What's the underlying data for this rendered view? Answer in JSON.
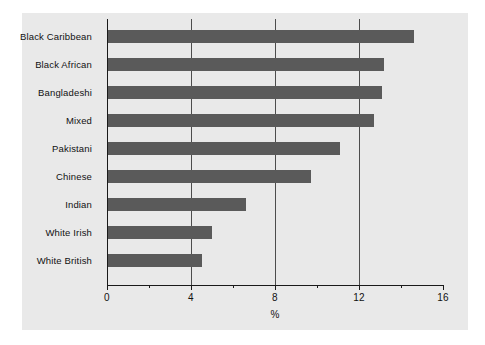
{
  "chart_data": {
    "type": "bar",
    "orientation": "horizontal",
    "title": "",
    "subtitle": "",
    "xlabel": "%",
    "ylabel": "",
    "categories": [
      "Black Caribbean",
      "Black African",
      "Bangladeshi",
      "Mixed",
      "Pakistani",
      "Chinese",
      "Indian",
      "White Irish",
      "White British"
    ],
    "values": [
      14.6,
      13.2,
      13.1,
      12.7,
      11.1,
      9.7,
      6.6,
      5.0,
      4.5
    ],
    "xlim": [
      0,
      16
    ],
    "xticks": [
      0,
      4,
      8,
      12,
      16
    ],
    "xticklabels": [
      "0",
      "4",
      "8",
      "12",
      "16"
    ],
    "xminorticks": [
      2,
      6,
      10,
      14
    ],
    "gridlines": [
      4,
      8,
      12
    ],
    "grid": true,
    "legend": null,
    "legend_position": "none",
    "bar_color": "#5a5a5a",
    "panel_color": "#e9e9e9",
    "axis_color": "#1a1a1a",
    "grid_color": "#4d4d4d",
    "background_color": "#ffffff"
  }
}
